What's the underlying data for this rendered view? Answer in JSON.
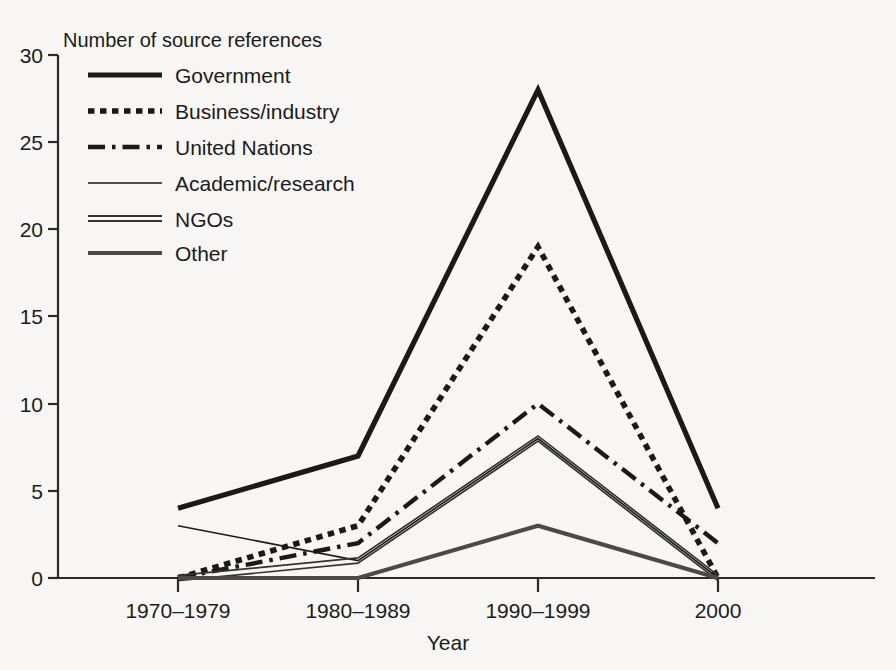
{
  "chart_data": {
    "type": "line",
    "title": "",
    "ylabel": "Number of source references",
    "xlabel": "Year",
    "categories": [
      "1970–1979",
      "1980–1989",
      "1990–1999",
      "2000"
    ],
    "ylim": [
      0,
      30
    ],
    "yticks": [
      0,
      5,
      10,
      15,
      20,
      25,
      30
    ],
    "grid": false,
    "legend_position": "upper-left-inside",
    "series": [
      {
        "name": "Government",
        "values": [
          4,
          7,
          28,
          4
        ],
        "style": "solid-thick",
        "color": "#1a1a1a"
      },
      {
        "name": "Business/industry",
        "values": [
          0,
          3,
          19,
          0
        ],
        "style": "dotted-thick",
        "color": "#1a1a1a"
      },
      {
        "name": "United Nations",
        "values": [
          0,
          2,
          10,
          2
        ],
        "style": "dash-dot",
        "color": "#1a1a1a"
      },
      {
        "name": "Academic/research",
        "values": [
          3,
          1,
          8,
          0
        ],
        "style": "solid-thin",
        "color": "#1a1a1a"
      },
      {
        "name": "NGOs",
        "values": [
          0,
          1,
          8,
          0
        ],
        "style": "double",
        "color": "#333333"
      },
      {
        "name": "Other",
        "values": [
          0,
          0,
          3,
          0
        ],
        "style": "solid-medium",
        "color": "#4a4a4a"
      }
    ]
  },
  "axis": {
    "y_tick_labels": [
      "30",
      "25",
      "20",
      "15",
      "10",
      "5",
      "0"
    ],
    "x_tick_labels": [
      "1970–1979",
      "1980–1989",
      "1990–1999",
      "2000"
    ],
    "y_axis_title": "Number of source references",
    "x_axis_title": "Year"
  },
  "legend": {
    "items": [
      {
        "label": "Government"
      },
      {
        "label": "Business/industry"
      },
      {
        "label": "United Nations"
      },
      {
        "label": "Academic/research"
      },
      {
        "label": "NGOs"
      },
      {
        "label": "Other"
      }
    ]
  }
}
